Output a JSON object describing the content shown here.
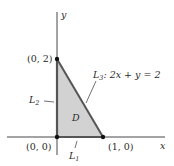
{
  "diagram": {
    "type": "region-plot",
    "axes": {
      "x_label": "x",
      "y_label": "y"
    },
    "region": {
      "label": "D",
      "fill": "#d2d2d2",
      "edge": "#555555"
    },
    "points": [
      {
        "label": "(0, 2)",
        "x": 0,
        "y": 2
      },
      {
        "label": "(0, 0)",
        "x": 0,
        "y": 0
      },
      {
        "label": "(1, 0)",
        "x": 1,
        "y": 0
      }
    ],
    "boundaries": [
      {
        "name": "L",
        "sub": "1",
        "equation": ""
      },
      {
        "name": "L",
        "sub": "2",
        "equation": ""
      },
      {
        "name": "L",
        "sub": "3",
        "equation": ": 2x + y = 2"
      }
    ]
  }
}
